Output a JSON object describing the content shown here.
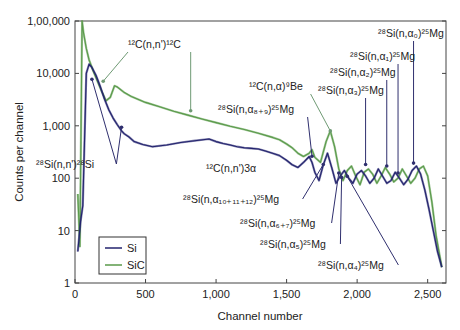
{
  "chart_data": {
    "type": "line",
    "title": "",
    "xlabel": "Channel number",
    "ylabel": "Counts per channel",
    "xlim": [
      0,
      2630
    ],
    "ylim": [
      1,
      100000
    ],
    "yscale": "log",
    "grid": false,
    "legend_position": "lower-left",
    "x_ticks": [
      0,
      500,
      1000,
      1500,
      2000,
      2500
    ],
    "x_tick_labels": [
      "0",
      "500",
      "1,000",
      "1,500",
      "2,000",
      "2,500"
    ],
    "y_ticks": [
      1,
      10,
      100,
      1000,
      10000,
      100000
    ],
    "y_tick_labels": [
      "1",
      "10",
      "100",
      "1,000",
      "10,000",
      "1,00,000"
    ],
    "colors": {
      "Si": "#23236e",
      "SiC": "#5a9a4a",
      "annotation_arrow_green": "#6f9a74",
      "annotation_arrow_blue": "#2f2f6e"
    },
    "series": [
      {
        "name": "Si",
        "x": [
          20,
          40,
          55,
          65,
          80,
          100,
          120,
          150,
          180,
          210,
          240,
          270,
          300,
          330,
          350,
          380,
          420,
          480,
          550,
          650,
          750,
          850,
          950,
          1000,
          1050,
          1100,
          1150,
          1200,
          1250,
          1300,
          1350,
          1400,
          1450,
          1500,
          1540,
          1580,
          1620,
          1660,
          1680,
          1700,
          1730,
          1760,
          1790,
          1820,
          1850,
          1880,
          1910,
          1940,
          1970,
          2000,
          2030,
          2060,
          2090,
          2120,
          2150,
          2180,
          2210,
          2240,
          2270,
          2300,
          2330,
          2360,
          2390,
          2420,
          2450,
          2480,
          2510,
          2540,
          2570,
          2600
        ],
        "y": [
          4,
          15,
          30,
          300,
          10000,
          15000,
          13000,
          9000,
          5500,
          3200,
          2000,
          1400,
          1050,
          800,
          700,
          620,
          500,
          440,
          400,
          430,
          480,
          520,
          560,
          500,
          460,
          430,
          400,
          380,
          370,
          360,
          330,
          300,
          270,
          220,
          180,
          160,
          200,
          260,
          200,
          130,
          90,
          180,
          300,
          160,
          80,
          110,
          140,
          100,
          80,
          120,
          140,
          110,
          80,
          100,
          150,
          110,
          80,
          90,
          130,
          100,
          75,
          95,
          140,
          170,
          120,
          60,
          25,
          10,
          4,
          2
        ]
      },
      {
        "name": "SiC",
        "x": [
          20,
          35,
          50,
          60,
          80,
          100,
          130,
          160,
          190,
          220,
          250,
          280,
          300,
          350,
          400,
          500,
          600,
          700,
          800,
          900,
          1000,
          1100,
          1200,
          1300,
          1400,
          1450,
          1500,
          1540,
          1580,
          1620,
          1660,
          1680,
          1700,
          1740,
          1780,
          1810,
          1840,
          1870,
          1900,
          1930,
          1960,
          1990,
          2020,
          2050,
          2080,
          2110,
          2140,
          2170,
          2200,
          2230,
          2260,
          2290,
          2320,
          2350,
          2380,
          2410,
          2440,
          2470,
          2500,
          2530,
          2560,
          2600
        ],
        "y": [
          50,
          5,
          100000,
          60000,
          30000,
          18000,
          11000,
          7000,
          4500,
          3000,
          3500,
          5800,
          5500,
          4300,
          3600,
          2800,
          2300,
          1900,
          1600,
          1350,
          1150,
          980,
          850,
          720,
          600,
          540,
          450,
          380,
          300,
          260,
          300,
          350,
          250,
          200,
          500,
          800,
          400,
          150,
          90,
          140,
          170,
          110,
          75,
          130,
          150,
          120,
          80,
          110,
          160,
          120,
          85,
          100,
          150,
          110,
          80,
          100,
          150,
          170,
          110,
          35,
          8,
          2
        ]
      }
    ],
    "annotations": [
      {
        "text": "¹²C(n,n')¹²C",
        "x_px": 128,
        "y_px": 48,
        "color": "green",
        "targets": [
          [
            200,
            6200
          ],
          [
            820,
            1700
          ]
        ]
      },
      {
        "text": "²⁸Si(n,n')²⁸Si",
        "x_px": 36,
        "y_px": 168,
        "color": "blue",
        "targets": [
          [
            120,
            6800
          ],
          [
            330,
            820
          ]
        ]
      },
      {
        "text": "¹²C(n,n')3α",
        "x_px": 206,
        "y_px": 172,
        "color": "none"
      },
      {
        "text": "¹²C(n,α)⁹Be",
        "x_px": 249,
        "y_px": 90,
        "color": "green",
        "targets": [
          [
            1810,
            700
          ]
        ]
      },
      {
        "text": "²⁸Si(n,α₈₊₉)²⁵Mg",
        "x_px": 218,
        "y_px": 113,
        "color": "blue",
        "targets": [
          [
            1680,
            230
          ]
        ]
      },
      {
        "text": "²⁸Si(n,α₀)²⁵Mg",
        "x_px": 378,
        "y_px": 37,
        "color": "blue",
        "targets": [
          [
            2400,
            170
          ]
        ]
      },
      {
        "text": "²⁸Si(n,α₁)²⁵Mg",
        "x_px": 350,
        "y_px": 60,
        "color": "blue",
        "targets": [
          [
            2290,
            110
          ]
        ]
      },
      {
        "text": "²⁸Si(n,α₂)²⁵Mg",
        "x_px": 330,
        "y_px": 76,
        "color": "blue",
        "targets": [
          [
            2210,
            150
          ]
        ]
      },
      {
        "text": "²⁸Si(n,α₃)²⁵Mg",
        "x_px": 318,
        "y_px": 94,
        "color": "blue",
        "targets": [
          [
            2060,
            160
          ]
        ]
      },
      {
        "text": "²⁸Si(n,α₁₀₊₁₁₊₁₂)²⁵Mg",
        "x_px": 183,
        "y_px": 203,
        "color": "blue",
        "targets": [
          [
            1760,
            160
          ]
        ]
      },
      {
        "text": "²⁸Si(n,α₆₊₇)²⁵Mg",
        "x_px": 240,
        "y_px": 227,
        "color": "blue",
        "targets": [
          [
            1870,
            110
          ]
        ]
      },
      {
        "text": "²⁸Si(n,α₅)²⁵Mg",
        "x_px": 260,
        "y_px": 248,
        "color": "blue",
        "targets": [
          [
            1890,
            90
          ]
        ]
      },
      {
        "text": "²⁸Si(n,α₄)²⁵Mg",
        "x_px": 318,
        "y_px": 269,
        "color": "blue",
        "targets": [
          [
            1930,
            95
          ]
        ]
      }
    ]
  },
  "legend": {
    "items": [
      {
        "label": "Si",
        "color": "#23236e"
      },
      {
        "label": "SiC",
        "color": "#5a9a4a"
      }
    ]
  },
  "axes": {
    "xlabel": "Channel number",
    "ylabel": "Counts per channel"
  }
}
